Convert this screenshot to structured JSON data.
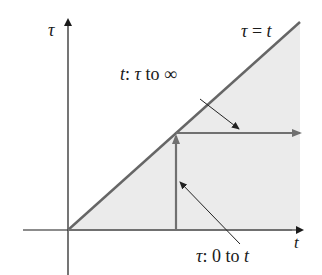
{
  "diagram": {
    "axes": {
      "vertical_label": "τ",
      "horizontal_label": "t"
    },
    "line_label": {
      "lhs": "τ",
      "eq": "=",
      "rhs": "t"
    },
    "annotation_upper": {
      "var": "t",
      "colon": ":",
      "from": "τ",
      "to_word": "to",
      "to": "∞"
    },
    "annotation_lower": {
      "var": "τ",
      "colon": ":",
      "from": "0",
      "to_word": "to",
      "to": "t"
    },
    "colors": {
      "axis": "#1a1a1a",
      "diagonal": "#666666",
      "arrows": "#707070",
      "shade": "#ebebeb",
      "leader": "#222222"
    }
  }
}
